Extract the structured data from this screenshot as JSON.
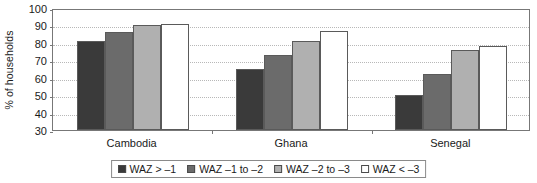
{
  "chart_data": {
    "type": "bar",
    "title": "",
    "subtitle": "",
    "xlabel": "",
    "ylabel": "% of households",
    "ylim": [
      30,
      100
    ],
    "ytick_values": [
      30,
      40,
      50,
      60,
      70,
      80,
      90,
      100
    ],
    "ytick_labels": [
      "30",
      "40",
      "50",
      "60",
      "70",
      "80",
      "90",
      "100"
    ],
    "grid": true,
    "grid_axis": "y",
    "legend_position": "bottom-center",
    "categories": [
      "Cambodia",
      "Ghana",
      "Senegal"
    ],
    "series": [
      {
        "name": "WAZ > –1",
        "color": "#3a3a3a",
        "values": [
          81,
          65,
          50
        ]
      },
      {
        "name": "WAZ –1 to –2",
        "color": "#6b6b6b",
        "values": [
          86,
          73,
          62
        ]
      },
      {
        "name": "WAZ –2 to –3",
        "color": "#b0b0b0",
        "values": [
          90,
          81,
          76
        ]
      },
      {
        "name": "WAZ < –3",
        "color": "#ffffff",
        "values": [
          91,
          87,
          78
        ]
      }
    ]
  },
  "colors": {
    "axis": "#777777",
    "gridline": "#b8b8b8",
    "bar_border": "#5a5a5a",
    "text": "#1a1a1a",
    "background": "#ffffff",
    "legend_border": "#8a8a8a"
  }
}
